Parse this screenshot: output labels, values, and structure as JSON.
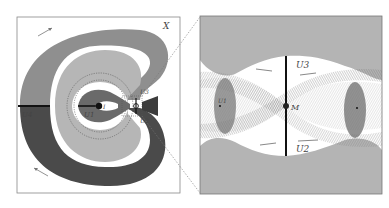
{
  "figure": {
    "left_panel": {
      "space_label": "X",
      "labels": {
        "u4": "U4",
        "u1": "U1",
        "u3": "U3",
        "u2": "U2",
        "center": "I"
      }
    },
    "right_panel": {
      "labels": {
        "u3": "U3",
        "u2": "U2",
        "u1": "U1",
        "m": "M"
      }
    },
    "colors": {
      "light_gray": "#b4b4b4",
      "mid_gray": "#8a8a8a",
      "dark_gray": "#4a4a4a",
      "frame": "#888888",
      "axis_black": "#111111",
      "dotted": "#555555"
    }
  }
}
